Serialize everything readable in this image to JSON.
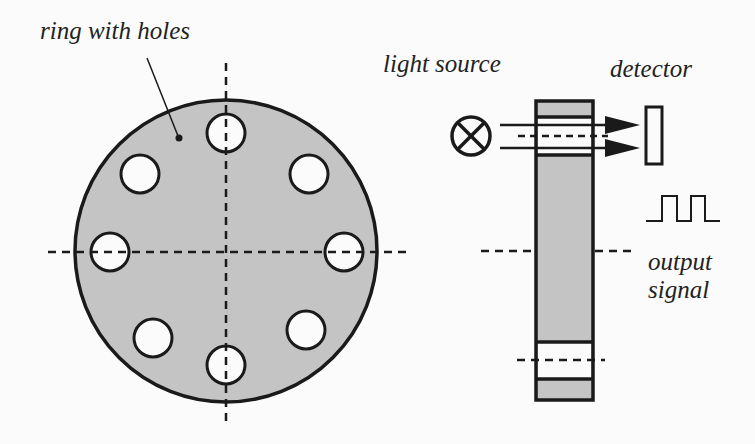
{
  "diagram": {
    "labels": {
      "ring": "ring with holes",
      "light_source": "light source",
      "detector": "detector",
      "output_line1": "output",
      "output_line2": "signal"
    },
    "colors": {
      "fill": "#c4c4c4",
      "stroke": "#1a1a1a",
      "background": "#fbfbfb"
    },
    "ring": {
      "hole_count": 8
    },
    "icons": {
      "light_source": "crossed-circle-lamp-icon",
      "signal": "square-pulse-icon"
    }
  }
}
